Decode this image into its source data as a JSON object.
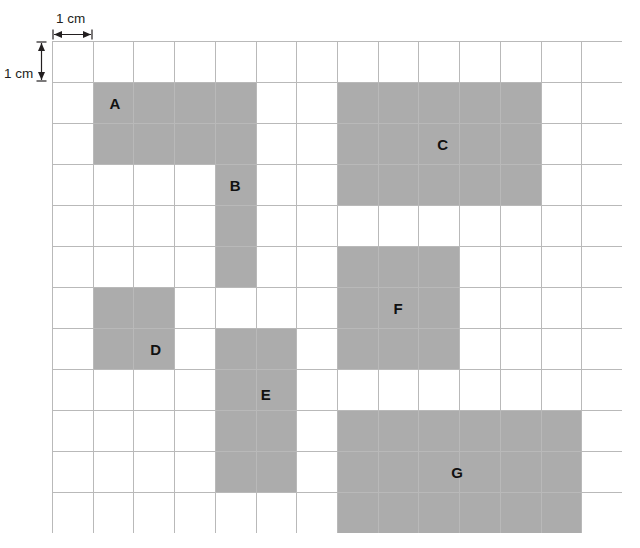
{
  "worksheet": {
    "title": "Area grid with labelled rectangles",
    "grid": {
      "columns": 14,
      "rows": 12,
      "cell_size_label": "1 cm",
      "line_color": "#b9b9b9",
      "shape_color": "#acacac"
    },
    "scale_annotations": {
      "horizontal_label": "1 cm",
      "vertical_label": "1 cm"
    },
    "shapes": [
      {
        "label": "A",
        "col": 1,
        "row": 1,
        "width": 3,
        "height": 2
      },
      {
        "label": "B",
        "col": 4,
        "row": 1,
        "width": 1,
        "height": 5
      },
      {
        "label": "C",
        "col": 7,
        "row": 1,
        "width": 5,
        "height": 3
      },
      {
        "label": "D",
        "col": 1,
        "row": 6,
        "width": 2,
        "height": 2
      },
      {
        "label": "E",
        "col": 4,
        "row": 7,
        "width": 2,
        "height": 4
      },
      {
        "label": "F",
        "col": 7,
        "row": 5,
        "width": 3,
        "height": 3
      },
      {
        "label": "G",
        "col": 7,
        "row": 9,
        "width": 6,
        "height": 3
      }
    ],
    "shape_label_offsets": [
      {
        "label": "A",
        "cx": 1.55,
        "cy": 1.52
      },
      {
        "label": "B",
        "cx": 4.5,
        "cy": 3.5
      },
      {
        "label": "C",
        "cx": 9.6,
        "cy": 2.5
      },
      {
        "label": "D",
        "cx": 2.55,
        "cy": 7.5
      },
      {
        "label": "E",
        "cx": 5.25,
        "cy": 8.6
      },
      {
        "label": "F",
        "cx": 8.5,
        "cy": 6.5
      },
      {
        "label": "G",
        "cx": 9.95,
        "cy": 10.5
      }
    ]
  }
}
